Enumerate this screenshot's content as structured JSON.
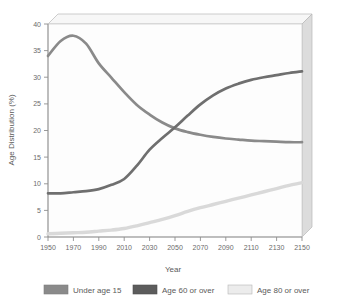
{
  "chart_data": {
    "type": "line",
    "title": "",
    "xlabel": "Year",
    "ylabel": "Age Distribution (%)",
    "xlim": [
      1950,
      2150
    ],
    "ylim": [
      0,
      40
    ],
    "grid": false,
    "legend_position": "bottom",
    "xticks": [
      "1950",
      "1970",
      "1990",
      "2010",
      "2030",
      "2050",
      "2070",
      "2090",
      "2110",
      "2130",
      "2150"
    ],
    "yticks": [
      "0",
      "5",
      "10",
      "15",
      "20",
      "25",
      "30",
      "35",
      "40"
    ],
    "x": [
      1950,
      1960,
      1970,
      1980,
      1990,
      2000,
      2010,
      2020,
      2030,
      2040,
      2050,
      2060,
      2070,
      2080,
      2090,
      2100,
      2110,
      2120,
      2130,
      2140,
      2150
    ],
    "series": [
      {
        "name": "Under age 15",
        "color": "#8a8a8a",
        "values": [
          34.0,
          36.8,
          37.8,
          36.3,
          32.6,
          29.9,
          27.2,
          24.8,
          23.0,
          21.5,
          20.4,
          19.7,
          19.2,
          18.8,
          18.5,
          18.3,
          18.1,
          18.0,
          17.9,
          17.8,
          17.8
        ]
      },
      {
        "name": "Age 60 or over",
        "color": "#6f6f6f",
        "values": [
          8.2,
          8.2,
          8.4,
          8.6,
          9.0,
          9.8,
          10.9,
          13.4,
          16.4,
          18.6,
          20.6,
          22.8,
          24.9,
          26.6,
          27.9,
          28.8,
          29.5,
          30.0,
          30.4,
          30.8,
          31.1
        ]
      },
      {
        "name": "Age 80 or over",
        "color": "#d9d9d9",
        "values": [
          0.6,
          0.7,
          0.8,
          0.9,
          1.1,
          1.3,
          1.6,
          2.1,
          2.7,
          3.3,
          4.0,
          4.8,
          5.5,
          6.1,
          6.7,
          7.3,
          7.9,
          8.5,
          9.1,
          9.7,
          10.2
        ]
      }
    ]
  },
  "legend": {
    "items": [
      {
        "label": "Under age 15",
        "color": "#8a8a8a"
      },
      {
        "label": "Age 60 or over",
        "color": "#5c5c5c"
      },
      {
        "label": "Age 80 or over",
        "color": "#e8e8e8"
      }
    ]
  },
  "colors": {
    "plot_background": "#fdfdfd",
    "wall_top": "#f2f2f2",
    "wall_right": "#d6d6d6",
    "axis": "#9a9a9a",
    "text": "#5a5a5a"
  }
}
